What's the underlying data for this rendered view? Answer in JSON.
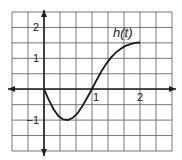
{
  "chart_data": {
    "type": "line",
    "title": "",
    "function_label": "h(t)",
    "xlabel": "",
    "ylabel": "",
    "xlim": [
      -0.67,
      2.67
    ],
    "ylim": [
      -1.9,
      2.5
    ],
    "x_ticks": [
      {
        "value": 1,
        "label": "1"
      },
      {
        "value": 2,
        "label": "2"
      }
    ],
    "y_ticks": [
      {
        "value": 2,
        "label": "2"
      },
      {
        "value": 1,
        "label": "1"
      },
      {
        "value": -1,
        "label": "−1"
      }
    ],
    "grid": true,
    "grid_step_x": 0.3333,
    "grid_step_y": 0.5,
    "series": [
      {
        "name": "h(t)",
        "x": [
          0,
          0.1,
          0.2,
          0.3,
          0.4,
          0.5,
          0.6,
          0.7,
          0.8,
          0.9,
          1.0,
          1.1,
          1.2,
          1.3,
          1.4,
          1.5,
          1.6,
          1.7,
          1.8,
          1.9,
          2.0
        ],
        "values": [
          0,
          -0.35,
          -0.65,
          -0.87,
          -0.98,
          -1.0,
          -0.93,
          -0.78,
          -0.55,
          -0.28,
          0,
          0.3,
          0.58,
          0.82,
          1.02,
          1.18,
          1.3,
          1.39,
          1.45,
          1.49,
          1.5
        ]
      }
    ],
    "colors": {
      "grid": "#555555",
      "axis": "#222222",
      "curve": "#1a1a1a",
      "background": "#ffffff"
    }
  }
}
